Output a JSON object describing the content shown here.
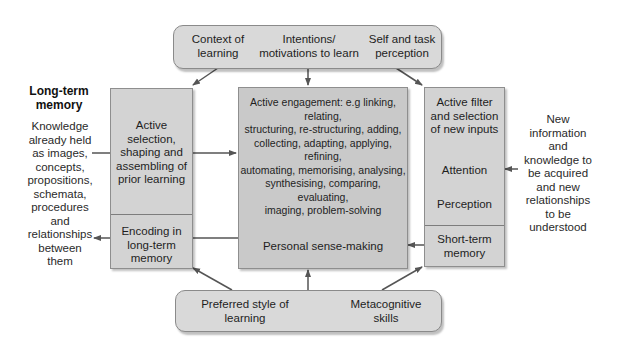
{
  "diagram": {
    "top_box": {
      "items": [
        {
          "label_line1": "Context of",
          "label_line2": "learning"
        },
        {
          "label_line1": "Intentions/",
          "label_line2": "motivations to learn"
        },
        {
          "label_line1": "Self and task",
          "label_line2": "perception"
        }
      ]
    },
    "left_title": {
      "line1": "Long-term",
      "line2": "memory"
    },
    "left_description": [
      "Knowledge",
      "already held",
      "as images,",
      "concepts,",
      "propositions,",
      "schemata,",
      "procedures",
      "and",
      "relationships",
      "between",
      "them"
    ],
    "left_box": {
      "upper": [
        "Active",
        "selection,",
        "shaping and",
        "assembling of",
        "prior learning"
      ],
      "lower": [
        "Encoding in",
        "long-term",
        "memory"
      ]
    },
    "center_box": {
      "lines": [
        "Active engagement: e.g linking, relating,",
        "structuring, re-structuring, adding,",
        "collecting, adapting, applying, refining,",
        "automating, memorising, analysing,",
        "synthesising, comparing, evaluating,",
        "imaging, problem-solving"
      ],
      "footer": "Personal sense-making"
    },
    "right_box": {
      "filter": [
        "Active filter",
        "and selection",
        "of new inputs"
      ],
      "attention": "Attention",
      "perception": "Perception",
      "lower": [
        "Short-term",
        "memory"
      ]
    },
    "right_description": [
      "New",
      "information",
      "and",
      "knowledge to",
      "be acquired",
      "and new",
      "relationships",
      "to be",
      "understood"
    ],
    "bottom_box": {
      "items": [
        {
          "label_line1": "Preferred style of",
          "label_line2": "learning"
        },
        {
          "label_line1": "Metacognitive",
          "label_line2": "skills"
        }
      ]
    },
    "colors": {
      "box_fill": "#d3d3d3",
      "center_fill": "#c9c9c9",
      "pill_fill": "#d9d9d9",
      "border": "#8e8e8e",
      "arrow": "#555555"
    }
  }
}
